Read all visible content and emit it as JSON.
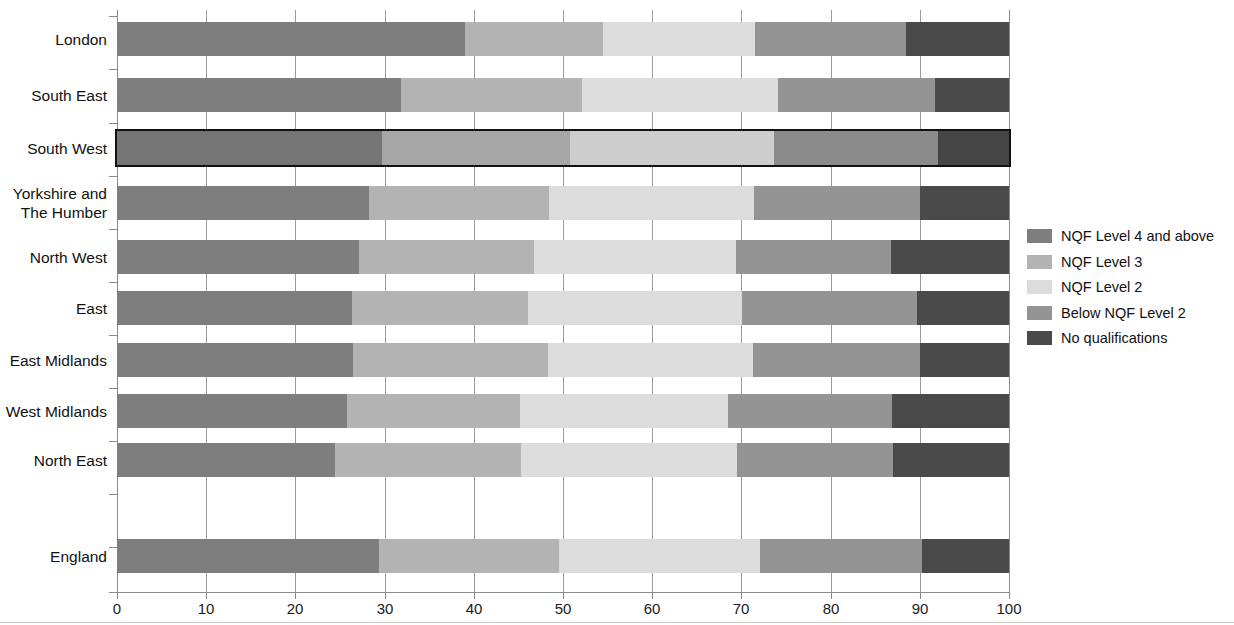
{
  "chart_data": {
    "type": "bar",
    "orientation": "horizontal",
    "stacked": true,
    "title": "",
    "subtitle": "",
    "xlabel": "",
    "ylabel": "",
    "xlim": [
      0,
      100
    ],
    "xticks": [
      0,
      10,
      20,
      30,
      40,
      50,
      60,
      70,
      80,
      90,
      100
    ],
    "xtick_labels": [
      "0",
      "10",
      "20",
      "30",
      "40",
      "50",
      "60",
      "70",
      "80",
      "90",
      "100"
    ],
    "grid": true,
    "grid_axis": "x",
    "legend_position": "right",
    "units": "per cent",
    "categories": [
      "London",
      "South East",
      "South West",
      "Yorkshire and\nThe Humber",
      "North West",
      "East",
      "East Midlands",
      "West Midlands",
      "North East",
      "England"
    ],
    "highlighted_category": "South West",
    "series": [
      {
        "name": "NQF Level 4 and above",
        "color": "#7e7e7e",
        "values": [
          39.0,
          31.8,
          29.7,
          28.2,
          27.1,
          26.3,
          26.5,
          25.8,
          24.4,
          29.4
        ]
      },
      {
        "name": "NQF Level 3",
        "color": "#b3b3b3",
        "values": [
          15.5,
          20.3,
          21.1,
          20.2,
          19.7,
          19.8,
          21.8,
          19.4,
          20.9,
          20.1
        ]
      },
      {
        "name": "NQF Level 2",
        "color": "#dcdcdc",
        "values": [
          17.0,
          22.0,
          22.8,
          23.0,
          22.6,
          24.0,
          23.0,
          23.3,
          24.2,
          22.6
        ]
      },
      {
        "name": "Below NQF Level 2",
        "color": "#949494",
        "values": [
          16.9,
          17.6,
          18.4,
          18.6,
          17.4,
          19.6,
          18.7,
          18.4,
          17.5,
          18.1
        ]
      },
      {
        "name": "No qualifications",
        "color": "#4a4a4a",
        "values": [
          11.6,
          8.3,
          8.0,
          10.0,
          13.2,
          10.3,
          10.0,
          13.1,
          13.0,
          9.8
        ]
      }
    ]
  },
  "legend": {
    "items": [
      {
        "label": "NQF Level 4 and above",
        "color": "#7e7e7e"
      },
      {
        "label": "NQF Level 3",
        "color": "#b3b3b3"
      },
      {
        "label": "NQF Level 2",
        "color": "#dcdcdc"
      },
      {
        "label": "Below NQF Level 2",
        "color": "#949494"
      },
      {
        "label": "No qualifications",
        "color": "#4a4a4a"
      }
    ]
  }
}
